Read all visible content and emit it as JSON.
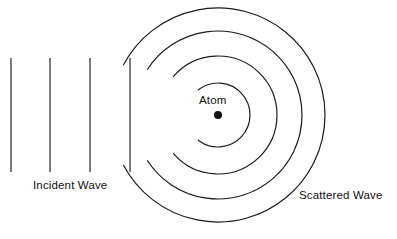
{
  "diagram": {
    "background_color": "#ffffff",
    "stroke_color": "#1a1a1a",
    "labels": {
      "incident_wave": "Incident Wave",
      "scattered_wave": "Scattered Wave",
      "atom": "Atom"
    },
    "incident_wave": {
      "type": "plane-wave",
      "wavefront_count": 4,
      "wavefronts": [
        {
          "x": 11,
          "y_top": 58,
          "y_bottom": 172
        },
        {
          "x": 50,
          "y_top": 58,
          "y_bottom": 172
        },
        {
          "x": 90,
          "y_top": 58,
          "y_bottom": 172
        },
        {
          "x": 130,
          "y_top": 58,
          "y_bottom": 172
        }
      ]
    },
    "scattered_wave": {
      "type": "circular-wave",
      "center": {
        "x": 218,
        "y": 115
      },
      "arc_count": 4,
      "arcs": [
        {
          "radius": 32,
          "start_angle_deg": 128,
          "end_angle_deg": 232
        },
        {
          "radius": 59,
          "start_angle_deg": 139,
          "end_angle_deg": 221
        },
        {
          "radius": 84,
          "start_angle_deg": 147,
          "end_angle_deg": 213
        },
        {
          "radius": 107,
          "start_angle_deg": 152,
          "end_angle_deg": 208
        }
      ]
    },
    "atom": {
      "center": {
        "x": 218,
        "y": 115
      },
      "radius": 4,
      "color": "#111111"
    }
  }
}
